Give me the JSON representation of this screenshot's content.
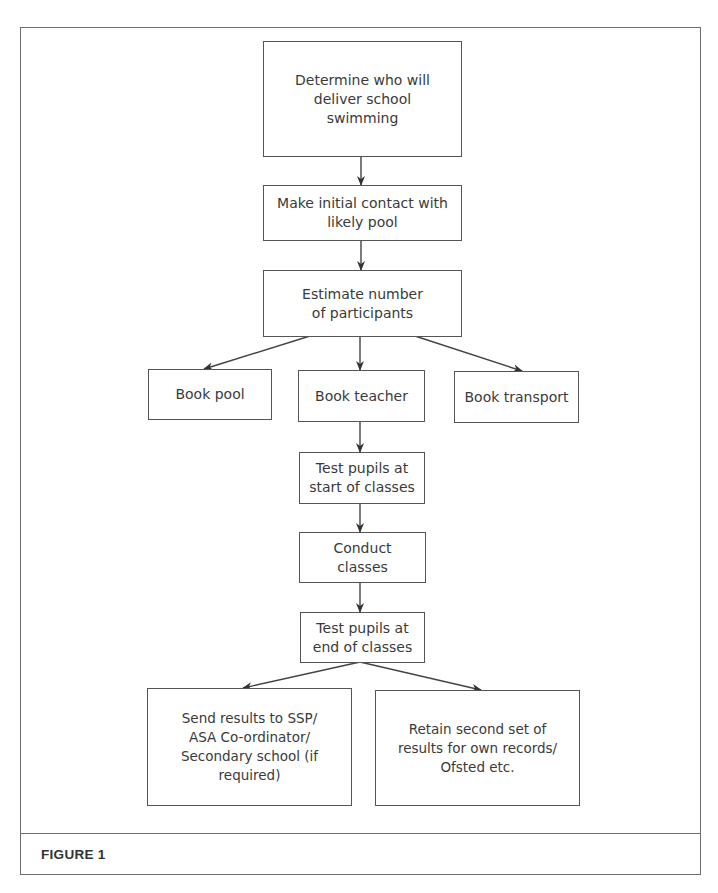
{
  "page": {
    "top_clipped_text": "...school swimming guidance (clipped)"
  },
  "diagram": {
    "nodes": [
      {
        "id": "determine",
        "label": "Determine who will\ndeliver school\nswimming"
      },
      {
        "id": "contact",
        "label": "Make initial contact with\nlikely pool"
      },
      {
        "id": "estimate",
        "label": "Estimate number\nof participants"
      },
      {
        "id": "book_pool",
        "label": "Book pool"
      },
      {
        "id": "book_teacher",
        "label": "Book teacher"
      },
      {
        "id": "book_transport",
        "label": "Book transport"
      },
      {
        "id": "test_start",
        "label": "Test pupils at\nstart of classes"
      },
      {
        "id": "conduct",
        "label": "Conduct classes"
      },
      {
        "id": "test_end",
        "label": "Test pupils at\nend of classes"
      },
      {
        "id": "send_results",
        "label": "Send results to SSP/\nASA Co-ordinator/\nSecondary school (if required)"
      },
      {
        "id": "retain_results",
        "label": "Retain second set of\nresults for own records/\nOfsted etc."
      }
    ],
    "edges": [
      {
        "from": "determine",
        "to": "contact"
      },
      {
        "from": "contact",
        "to": "estimate"
      },
      {
        "from": "estimate",
        "to": "book_pool"
      },
      {
        "from": "estimate",
        "to": "book_teacher"
      },
      {
        "from": "estimate",
        "to": "book_transport"
      },
      {
        "from": "book_teacher",
        "to": "test_start"
      },
      {
        "from": "test_start",
        "to": "conduct"
      },
      {
        "from": "conduct",
        "to": "test_end"
      },
      {
        "from": "test_end",
        "to": "send_results"
      },
      {
        "from": "test_end",
        "to": "retain_results"
      }
    ]
  },
  "caption": {
    "label": "FIGURE 1"
  },
  "colors": {
    "border": "#555555",
    "frame": "#6e6e6e",
    "text": "#3a3a3a"
  }
}
